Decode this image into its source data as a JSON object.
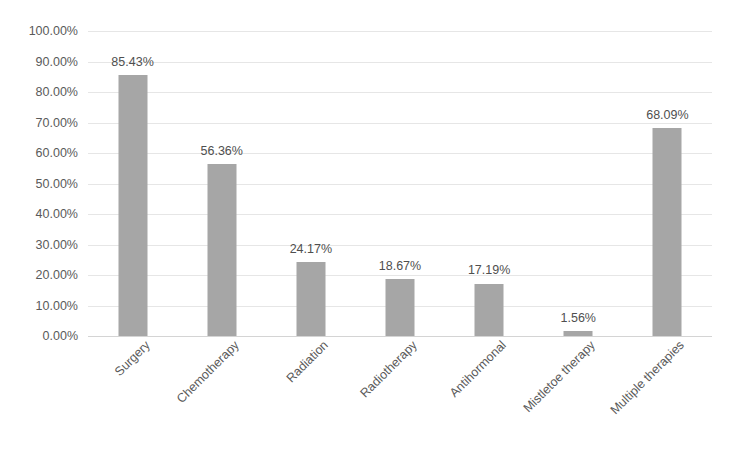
{
  "chart_data": {
    "type": "bar",
    "title": "",
    "xlabel": "",
    "ylabel": "",
    "ylim": [
      0,
      100
    ],
    "ytick_format": "percent",
    "grid": true,
    "legend": "none",
    "orientation": "vertical",
    "bar_color": "#a6a6a6",
    "gridline_color": "#e6e6e6",
    "text_color": "#5a5a5a",
    "categories": [
      "Surgery",
      "Chemotherapy",
      "Radiation",
      "Radiotherapy",
      "Antihormonal",
      "Mistletoe therapy",
      "Multiple therapies"
    ],
    "values": [
      85.43,
      56.36,
      24.17,
      18.67,
      17.19,
      1.56,
      68.09
    ],
    "data_labels": [
      "85.43%",
      "56.36%",
      "24.17%",
      "18.67%",
      "17.19%",
      "1.56%",
      "68.09%"
    ],
    "yticks": [
      0,
      10,
      20,
      30,
      40,
      50,
      60,
      70,
      80,
      90,
      100
    ],
    "ytick_labels": [
      "0.00%",
      "10.00%",
      "20.00%",
      "30.00%",
      "40.00%",
      "50.00%",
      "60.00%",
      "70.00%",
      "80.00%",
      "90.00%",
      "100.00%"
    ]
  }
}
